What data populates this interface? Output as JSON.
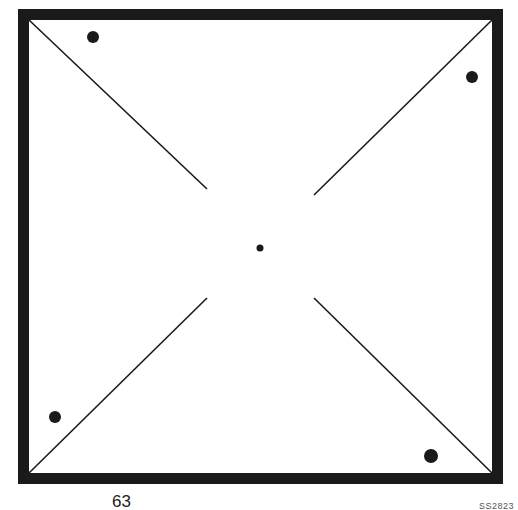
{
  "figure": {
    "page_number": "63",
    "code": "SS2823",
    "colors": {
      "ink": "#1a1a1a",
      "background": "#ffffff"
    },
    "frame": {
      "outer": [
        18,
        9,
        503,
        484
      ],
      "thickness": 11
    },
    "diagonals": [
      {
        "x1": 29,
        "y1": 20,
        "x2": 207,
        "y2": 189
      },
      {
        "x1": 492,
        "y1": 20,
        "x2": 314,
        "y2": 195
      },
      {
        "x1": 29,
        "y1": 473,
        "x2": 207,
        "y2": 298
      },
      {
        "x1": 492,
        "y1": 473,
        "x2": 314,
        "y2": 298
      }
    ],
    "dots": [
      {
        "name": "top-left-dot",
        "cx": 93,
        "cy": 37,
        "r": 6
      },
      {
        "name": "top-right-dot",
        "cx": 472,
        "cy": 77,
        "r": 6
      },
      {
        "name": "bottom-left-dot",
        "cx": 55,
        "cy": 417,
        "r": 6
      },
      {
        "name": "bottom-right-dot",
        "cx": 431,
        "cy": 456,
        "r": 7
      },
      {
        "name": "center-dot",
        "cx": 260,
        "cy": 248,
        "r": 3.5
      }
    ]
  }
}
